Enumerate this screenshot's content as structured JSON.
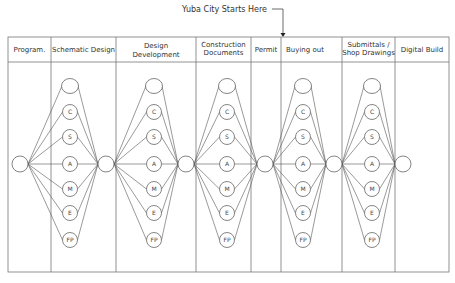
{
  "annotation": {
    "label": "Yuba City Starts Here",
    "target_column": "Buying out"
  },
  "columns": [
    {
      "lines": [
        "Program."
      ]
    },
    {
      "lines": [
        "Schematic Design"
      ]
    },
    {
      "lines": [
        "Design",
        "Development"
      ]
    },
    {
      "lines": [
        "Construction",
        "Documents"
      ]
    },
    {
      "lines": [
        "Permit"
      ]
    },
    {
      "lines": [
        "Buying out"
      ]
    },
    {
      "lines": [
        "Submittals /",
        "Shop Drawings"
      ]
    },
    {
      "lines": [
        "Digital Build"
      ]
    }
  ],
  "discipline_nodes": [
    "",
    "C",
    "S",
    "A",
    "M",
    "E",
    "FP"
  ],
  "clusters": 5,
  "hub_nodes": 6,
  "colors": {
    "line": "#555555",
    "border": "#777777",
    "text": "#333333"
  }
}
